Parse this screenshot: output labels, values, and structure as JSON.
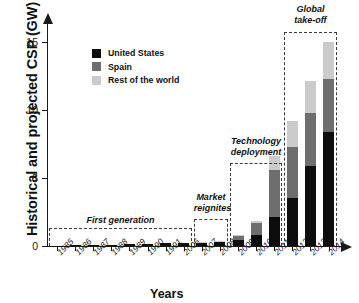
{
  "chart_data": {
    "type": "bar",
    "title": "",
    "stacked": true,
    "xlabel": "Years",
    "ylabel": "Historical and projected CSP (GW)",
    "categories": [
      "1985",
      "1986",
      "1987",
      "1988",
      "1989",
      "1990",
      "1991",
      "2006",
      "2007",
      "2008",
      "2009",
      "2010",
      "2011",
      "2012",
      "2013",
      "2014"
    ],
    "yticks": [
      0,
      5,
      10,
      15
    ],
    "ylim": [
      0,
      16.2
    ],
    "grid": false,
    "legend_position": "upper-left-inside",
    "series": [
      {
        "name": "United States",
        "color": "#0d0d0d",
        "values": [
          0.014,
          0.044,
          0.074,
          0.104,
          0.134,
          0.164,
          0.194,
          0.194,
          0.204,
          0.274,
          0.45,
          0.8,
          2.1,
          3.5,
          5.9,
          8.4
        ]
      },
      {
        "name": "Spain",
        "color": "#6e6e6e",
        "values": [
          0,
          0,
          0,
          0,
          0,
          0,
          0,
          0,
          0.06,
          0.06,
          0.25,
          0.9,
          3.5,
          3.8,
          3.9,
          3.9
        ]
      },
      {
        "name": "Rest of the world",
        "color": "#cbcbcb",
        "values": [
          0,
          0,
          0,
          0,
          0,
          0,
          0,
          0,
          0.04,
          0.04,
          0.1,
          0.15,
          1.0,
          1.9,
          2.3,
          2.7
        ]
      }
    ],
    "totals": [
      0.014,
      0.044,
      0.074,
      0.104,
      0.134,
      0.164,
      0.194,
      0.194,
      0.3,
      0.37,
      0.8,
      1.85,
      6.6,
      9.2,
      12.1,
      15.0
    ],
    "annotations": [
      {
        "id": "first-generation",
        "label": "First generation",
        "spans": [
          "1985",
          "2006"
        ]
      },
      {
        "id": "market-reignites",
        "label": "Market\nreignites",
        "spans": [
          "2007",
          "2008"
        ]
      },
      {
        "id": "technology-deployment",
        "label": "Technology\ndeployment",
        "spans": [
          "2009",
          "2011"
        ]
      },
      {
        "id": "global-take-off",
        "label": "Global\ntake-off",
        "spans": [
          "2012",
          "2014"
        ]
      }
    ]
  }
}
